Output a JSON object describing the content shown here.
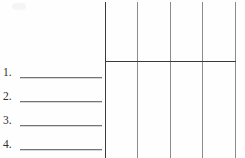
{
  "page": {
    "kind": "worksheet-scan",
    "width": 245,
    "height": 158,
    "background_color": "#fefefe"
  },
  "answer_list": {
    "name": "numbered-answer-lines",
    "blank_line_color": "#5d5d5d",
    "items": [
      {
        "number": "1.",
        "value": "",
        "y": 77
      },
      {
        "number": "2.",
        "value": "",
        "y": 101
      },
      {
        "number": "3.",
        "value": "",
        "y": 125
      },
      {
        "number": "4.",
        "value": "",
        "y": 149
      }
    ]
  },
  "grid": {
    "name": "blank-table-grid",
    "line_color": "#8c8c8c",
    "heavy_line_color": "#3b3b3b",
    "column_count": 4,
    "vertical_lines": [
      {
        "x": 105,
        "weight": "heavy"
      },
      {
        "x": 137,
        "weight": "light"
      },
      {
        "x": 170,
        "weight": "light"
      },
      {
        "x": 202,
        "weight": "light"
      },
      {
        "x": 235,
        "weight": "light"
      }
    ],
    "horizontal_lines": [
      {
        "y": 61,
        "weight": "heavy",
        "x_start": 105,
        "x_end": 236
      }
    ],
    "header_row": {
      "top": 2,
      "bottom": 61,
      "cells": [
        "",
        "",
        "",
        ""
      ]
    },
    "body_cells": [
      "",
      "",
      "",
      ""
    ]
  },
  "artifacts": {
    "smudge": {
      "name": "scan-smudge",
      "x": 12,
      "y": 3
    }
  }
}
